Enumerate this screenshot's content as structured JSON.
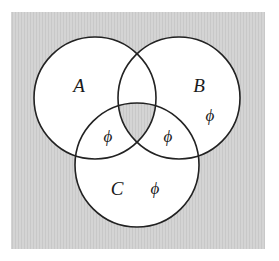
{
  "diagram": {
    "type": "venn-3",
    "colors": {
      "background_box": "#d2d2d2",
      "circle_fill": "#ffffff",
      "shaded_region": "#d2d2d2",
      "stroke": "#222222"
    },
    "sets": [
      {
        "id": "A",
        "label": "A",
        "cx": 95,
        "cy": 98,
        "r": 61,
        "label_x": 79,
        "label_y": 92
      },
      {
        "id": "B",
        "label": "B",
        "cx": 179,
        "cy": 98,
        "r": 61,
        "label_x": 199,
        "label_y": 92
      },
      {
        "id": "C",
        "label": "C",
        "cx": 137,
        "cy": 165,
        "r": 62,
        "label_x": 117,
        "label_y": 195
      }
    ],
    "shaded_regions": [
      "A∩B∩C"
    ],
    "empty_markers": [
      {
        "region": "A∩C only",
        "symbol": "ϕ",
        "x": 108,
        "y": 142
      },
      {
        "region": "B∩C only",
        "symbol": "ϕ",
        "x": 168,
        "y": 142
      },
      {
        "region": "B only",
        "symbol": "ϕ",
        "x": 210,
        "y": 121
      },
      {
        "region": "C only",
        "symbol": "ϕ",
        "x": 155,
        "y": 194
      }
    ]
  },
  "labels": {
    "set_a": "A",
    "set_b": "B",
    "set_c": "C",
    "phi_ac": "ϕ",
    "phi_bc": "ϕ",
    "phi_b": "ϕ",
    "phi_c": "ϕ"
  }
}
